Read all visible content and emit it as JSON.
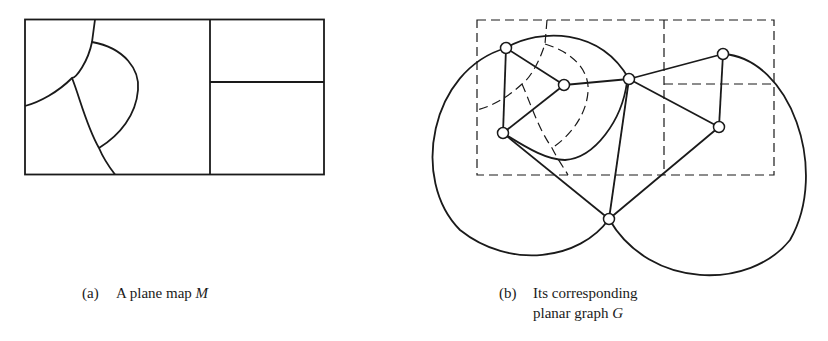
{
  "figure_a": {
    "caption_tag": "(a)",
    "caption_text": "A plane map ",
    "caption_var": "M"
  },
  "figure_b": {
    "caption_tag": "(b)",
    "caption_line1": "Its corresponding",
    "caption_line2_text": "planar graph ",
    "caption_var": "G",
    "vertices": [
      {
        "id": "A",
        "x": 506,
        "y": 48
      },
      {
        "id": "B",
        "x": 564,
        "y": 85
      },
      {
        "id": "C",
        "x": 629,
        "y": 79
      },
      {
        "id": "D",
        "x": 723,
        "y": 54
      },
      {
        "id": "E",
        "x": 719,
        "y": 127
      },
      {
        "id": "F",
        "x": 503,
        "y": 133
      },
      {
        "id": "G",
        "x": 609,
        "y": 219
      }
    ],
    "edges": [
      [
        "A",
        "B"
      ],
      [
        "A",
        "F"
      ],
      [
        "B",
        "F"
      ],
      [
        "B",
        "C"
      ],
      [
        "C",
        "D"
      ],
      [
        "C",
        "E"
      ],
      [
        "D",
        "E"
      ],
      [
        "C",
        "G"
      ],
      [
        "F",
        "G"
      ],
      [
        "E",
        "G"
      ],
      [
        "F",
        "C"
      ],
      [
        "A",
        "C"
      ],
      [
        "A",
        "G"
      ],
      [
        "D",
        "G"
      ]
    ]
  },
  "colors": {
    "stroke": "#1a1a1a",
    "background": "#ffffff"
  }
}
